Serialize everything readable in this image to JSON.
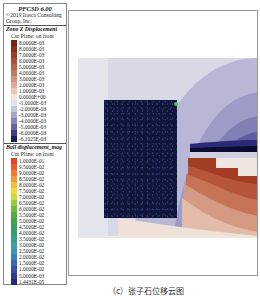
{
  "legend": {
    "title": "PFC3D 6.00",
    "copyright": [
      "©2019 Itasca Consulting",
      "Group, Inc."
    ],
    "zone_section": {
      "title": "Zone Z Displacement",
      "subtitle": "Cut Plane: on front",
      "entries": [
        {
          "label": "8.0000E-03",
          "color": "#7a2410"
        },
        {
          "label": "8.0000E-03",
          "color": "#8b3018"
        },
        {
          "label": "7.0000E-03",
          "color": "#9a3e26"
        },
        {
          "label": "6.0000E-03",
          "color": "#aa5038"
        },
        {
          "label": "5.0000E-03",
          "color": "#b8644c"
        },
        {
          "label": "4.0000E-03",
          "color": "#c57a63"
        },
        {
          "label": "3.0000E-03",
          "color": "#d2917c"
        },
        {
          "label": "2.0000E-03",
          "color": "#deaa98"
        },
        {
          "label": "1.0000E-03",
          "color": "#e9c6b8"
        },
        {
          "label": "0.0000E+00",
          "color": "#f2e4dc"
        },
        {
          "label": "-1.0000E-03",
          "color": "#e2e2ee"
        },
        {
          "label": "-2.0000E-03",
          "color": "#c4c4dc"
        },
        {
          "label": "-3.0000E-03",
          "color": "#a6a6cb"
        },
        {
          "label": "-4.0000E-03",
          "color": "#8686b8"
        },
        {
          "label": "-5.0000E-03",
          "color": "#6464a2"
        },
        {
          "label": "-6.0000E-03",
          "color": "#3e3e86"
        },
        {
          "label": "-6.1025E-03",
          "color": "#1c1c5a"
        }
      ]
    },
    "ball_section": {
      "title": "Ball displacement_mag",
      "subtitle": "Cut Plane: on front",
      "entries": [
        {
          "label": "1.0000E-01",
          "color": "#e8402a"
        },
        {
          "label": "9.5000E-02",
          "color": "#ee5a2c"
        },
        {
          "label": "9.0000E-02",
          "color": "#f27a30"
        },
        {
          "label": "8.5000E-02",
          "color": "#f59a34"
        },
        {
          "label": "8.0000E-02",
          "color": "#f6bc3a"
        },
        {
          "label": "7.5000E-02",
          "color": "#eedc3c"
        },
        {
          "label": "7.0000E-02",
          "color": "#c8dc3a"
        },
        {
          "label": "6.5000E-02",
          "color": "#98cc3a"
        },
        {
          "label": "6.0000E-02",
          "color": "#6cbc3c"
        },
        {
          "label": "5.5000E-02",
          "color": "#4cb040"
        },
        {
          "label": "5.0000E-02",
          "color": "#3ca84a"
        },
        {
          "label": "4.5000E-02",
          "color": "#36a05a"
        },
        {
          "label": "4.0000E-02",
          "color": "#34a070"
        },
        {
          "label": "3.5000E-02",
          "color": "#34a08a"
        },
        {
          "label": "3.0000E-02",
          "color": "#3aa0a4"
        },
        {
          "label": "2.5000E-02",
          "color": "#3c94b6"
        },
        {
          "label": "2.0000E-02",
          "color": "#3c80bc"
        },
        {
          "label": "1.5000E-02",
          "color": "#3a68b4"
        },
        {
          "label": "1.0000E-02",
          "color": "#3650a4"
        },
        {
          "label": "5.0000E-03",
          "color": "#2e3a8e"
        },
        {
          "label": "1.4431E-05",
          "color": "#26287a"
        }
      ]
    }
  },
  "plot": {
    "block_color": "#101638"
  },
  "caption": "（c）张子石位移云图"
}
